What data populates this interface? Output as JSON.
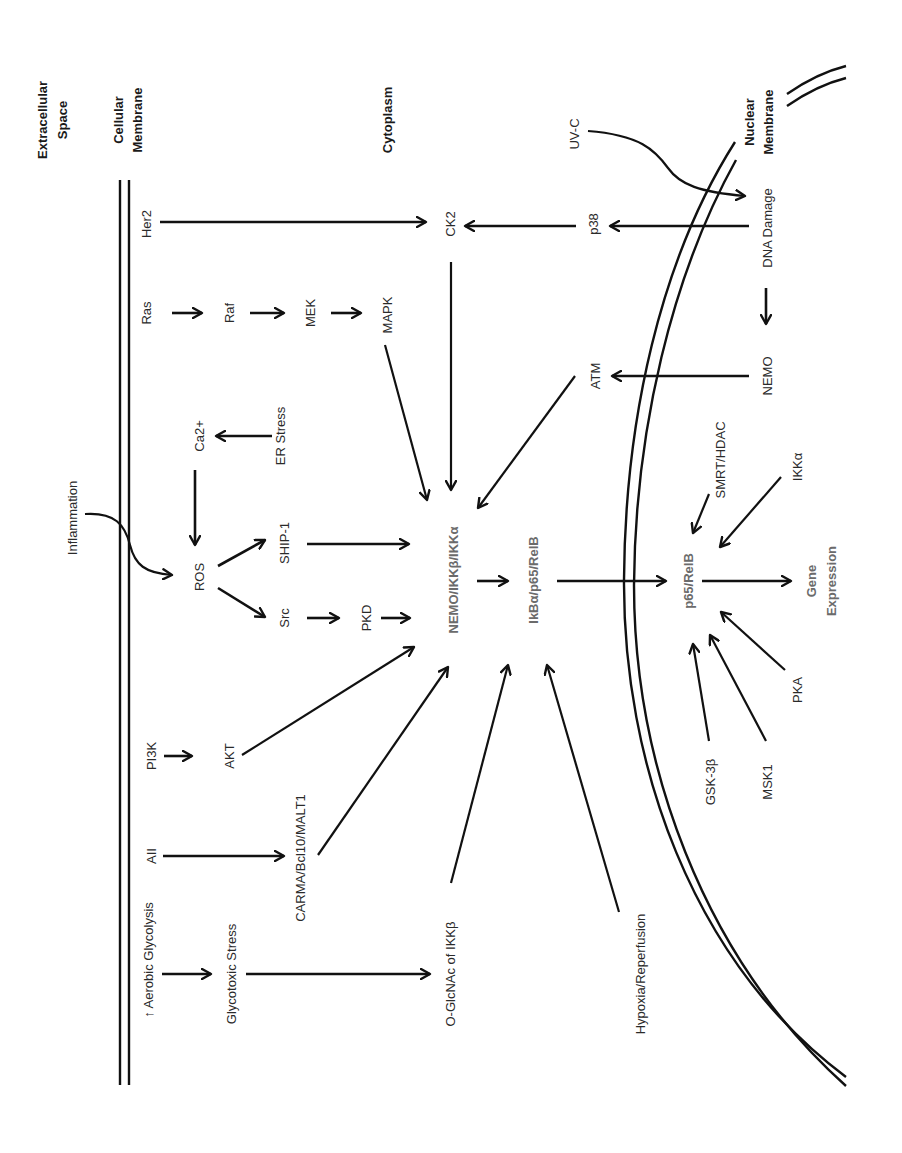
{
  "figure": {
    "regions": {
      "extracellular": [
        "Extracellular",
        "Space"
      ],
      "cellular_membrane": [
        "Cellular",
        "Membrane"
      ],
      "cytoplasm": "Cytoplasm",
      "nuclear_membrane": [
        "Nuclear",
        "Membrane"
      ]
    },
    "nodes": {
      "her2": "Her2",
      "ck2": "CK2",
      "p38": "p38",
      "dna_damage": "DNA Damage",
      "uvc": "UV-C",
      "ras": "Ras",
      "raf": "Raf",
      "mek": "MEK",
      "mapk": "MAPK",
      "atm": "ATM",
      "nemo_nuc": "NEMO",
      "ca2": "Ca2+",
      "er_stress": "ER Stress",
      "inflammation": "Inflammation",
      "ros": "ROS",
      "ship1": "SHIP-1",
      "src": "Src",
      "pkd": "PKD",
      "ikk_complex": "NEMO/IKKβ/IKKα",
      "ikb_complex": "IkBα/p65/RelB",
      "p65_relb": "p65/RelB",
      "smrt_hdac": "SMRT/HDAC",
      "ikka": "IKKα",
      "gene_expr": [
        "Gene",
        "Expression"
      ],
      "pka": "PKA",
      "msk1": "MSK1",
      "gsk3b": "GSK-3β",
      "pi3k": "PI3K",
      "akt": "AKT",
      "aii": "AII",
      "carma": "CARMA/Bcl10/MALT1",
      "aerobic": "↑ Aerobic Glycolysis",
      "glycotoxic": "Glycotoxic Stress",
      "oglcnac": "O-GlcNAc of IKKβ",
      "hypoxia": "Hypoxia/Reperfusion"
    },
    "edges": [
      [
        "Her2",
        "CK2"
      ],
      [
        "p38",
        "CK2"
      ],
      [
        "DNA Damage",
        "p38"
      ],
      [
        "UV-C",
        "DNA Damage"
      ],
      [
        "DNA Damage",
        "NEMO"
      ],
      [
        "NEMO",
        "ATM"
      ],
      [
        "ATM",
        "NEMO/IKKβ/IKKα"
      ],
      [
        "CK2",
        "NEMO/IKKβ/IKKα"
      ],
      [
        "Ras",
        "Raf"
      ],
      [
        "Raf",
        "MEK"
      ],
      [
        "MEK",
        "MAPK"
      ],
      [
        "MAPK",
        "NEMO/IKKβ/IKKα"
      ],
      [
        "ER Stress",
        "Ca2+"
      ],
      [
        "Ca2+",
        "ROS"
      ],
      [
        "Inflammation",
        "ROS"
      ],
      [
        "ROS",
        "SHIP-1"
      ],
      [
        "ROS",
        "Src"
      ],
      [
        "SHIP-1",
        "NEMO/IKKβ/IKKα"
      ],
      [
        "Src",
        "PKD"
      ],
      [
        "PKD",
        "NEMO/IKKβ/IKKα"
      ],
      [
        "PI3K",
        "AKT"
      ],
      [
        "AKT",
        "NEMO/IKKβ/IKKα"
      ],
      [
        "AII",
        "CARMA/Bcl10/MALT1"
      ],
      [
        "CARMA/Bcl10/MALT1",
        "NEMO/IKKβ/IKKα"
      ],
      [
        "Aerobic Glycolysis",
        "Glycotoxic Stress"
      ],
      [
        "Glycotoxic Stress",
        "O-GlcNAc of IKKβ"
      ],
      [
        "O-GlcNAc of IKKβ",
        "IkBα/p65/RelB"
      ],
      [
        "Hypoxia/Reperfusion",
        "IkBα/p65/RelB"
      ],
      [
        "NEMO/IKKβ/IKKα",
        "IkBα/p65/RelB"
      ],
      [
        "IkBα/p65/RelB",
        "p65/RelB"
      ],
      [
        "SMRT/HDAC",
        "p65/RelB"
      ],
      [
        "IKKα",
        "p65/RelB"
      ],
      [
        "p65/RelB",
        "Gene Expression"
      ],
      [
        "PKA",
        "p65/RelB"
      ],
      [
        "MSK1",
        "p65/RelB"
      ],
      [
        "GSK-3β",
        "p65/RelB"
      ]
    ]
  }
}
